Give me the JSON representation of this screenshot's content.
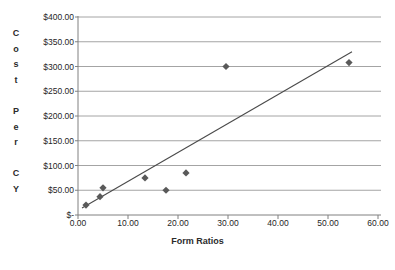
{
  "chart_data": {
    "type": "scatter",
    "title": "",
    "xlabel": "Form Ratios",
    "ylabel": "Cost Per CY",
    "ylabel_stacked": "C\no\ns\nt\n\nP\ne\nr\n\nC\nY",
    "xlim": [
      0,
      60
    ],
    "ylim": [
      0,
      400
    ],
    "grid": "horizontal",
    "legend": "none",
    "x_tick_labels": [
      "0.00",
      "10.00",
      "20.00",
      "30.00",
      "40.00",
      "50.00",
      "60.00"
    ],
    "x_tick_values": [
      0,
      10,
      20,
      30,
      40,
      50,
      60
    ],
    "y_tick_labels": [
      "$-",
      "$50.00",
      "$100.00",
      "$150.00",
      "$200.00",
      "$250.00",
      "$300.00",
      "$350.00",
      "$400.00"
    ],
    "y_tick_values": [
      0,
      50,
      100,
      150,
      200,
      250,
      300,
      350,
      400
    ],
    "series": [
      {
        "name": "Cost Per CY",
        "marker": "diamond",
        "color": "#595959",
        "points": [
          {
            "x": 1.6,
            "y": 20
          },
          {
            "x": 4.4,
            "y": 37
          },
          {
            "x": 5.0,
            "y": 55
          },
          {
            "x": 13.4,
            "y": 75
          },
          {
            "x": 17.6,
            "y": 50
          },
          {
            "x": 21.6,
            "y": 85
          },
          {
            "x": 29.6,
            "y": 300
          },
          {
            "x": 54.2,
            "y": 308
          }
        ]
      }
    ],
    "trendline": {
      "name": "Linear trendline",
      "color": "#4a4a4a",
      "x0": 0.8,
      "y0": 14,
      "x1": 54.8,
      "y1": 330
    },
    "colors": {
      "marker": "#595959",
      "trendline": "#4a4a4a",
      "gridline": "#9a9a9a",
      "axis": "#808080",
      "text": "#262626",
      "background": "#ffffff"
    }
  }
}
